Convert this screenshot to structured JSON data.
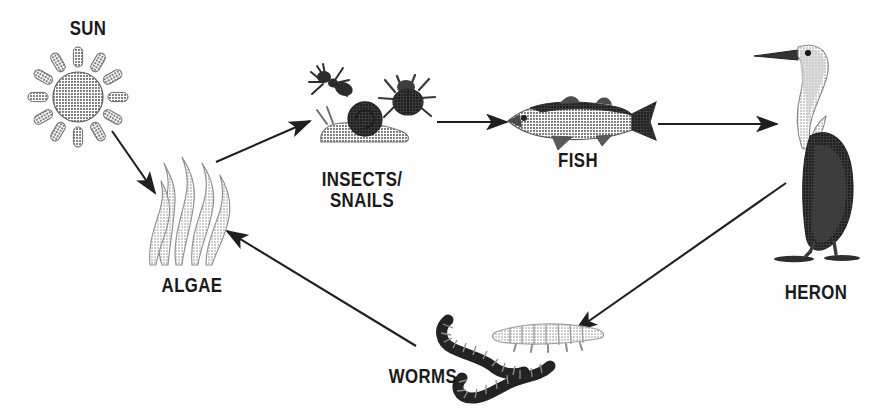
{
  "diagram": {
    "background_color": "#fdfdfd",
    "ink_color": "#1a1a1a",
    "style": "grayscale halftone illustration"
  },
  "nodes": [
    {
      "id": "sun",
      "label": "SUN",
      "icon": "sun-icon",
      "label_x": 88,
      "label_y": 30,
      "icon_x": 78,
      "icon_y": 96,
      "font_size": 21,
      "colors": {
        "disc": "#7a7a7a",
        "rays": "#8a8a8a"
      }
    },
    {
      "id": "algae",
      "label": "ALGAE",
      "icon": "algae-icon",
      "label_x": 192,
      "label_y": 288,
      "icon_x": 192,
      "icon_y": 200,
      "font_size": 21,
      "colors": {
        "blade": "#b4b4b4",
        "outline": "#8d8d8d"
      }
    },
    {
      "id": "insects_snails",
      "label": "INSECTS/\nSNAILS",
      "icon": "insects-snails-icon",
      "label_x": 362,
      "label_y": 196,
      "icon_x": 352,
      "icon_y": 105,
      "font_size": 21,
      "colors": {
        "ant": "#2d2d2d",
        "beetle": "#4a4a4a",
        "snail_body": "#9a9a9a",
        "snail_shell": "#4e4e4e"
      }
    },
    {
      "id": "fish",
      "label": "FISH",
      "icon": "fish-icon",
      "label_x": 578,
      "label_y": 163,
      "icon_x": 578,
      "icon_y": 120,
      "font_size": 21,
      "colors": {
        "body": "#b0b0b0",
        "back": "#4e4e4e",
        "fin": "#6a6a6a"
      }
    },
    {
      "id": "heron",
      "label": "HERON",
      "icon": "heron-icon",
      "label_x": 812,
      "label_y": 295,
      "icon_x": 805,
      "icon_y": 150,
      "font_size": 21,
      "colors": {
        "body": "#4a4a4a",
        "neck": "#c8c8c8",
        "beak": "#3a3a3a",
        "legs": "#4a4a4a"
      }
    },
    {
      "id": "worms",
      "label": "WORMS",
      "icon": "worms-icon",
      "label_x": 418,
      "label_y": 379,
      "icon_x": 520,
      "icon_y": 345,
      "font_size": 21,
      "colors": {
        "dark_worm": "#232323",
        "light_worm": "#a9a9a9"
      }
    }
  ],
  "arrows": [
    {
      "id": "sun-to-algae",
      "from": "sun",
      "to": "algae",
      "x1": 112,
      "y1": 131,
      "x2": 155,
      "y2": 193
    },
    {
      "id": "algae-to-insects",
      "from": "algae",
      "to": "insects_snails",
      "x1": 216,
      "y1": 162,
      "x2": 310,
      "y2": 121
    },
    {
      "id": "insects-to-fish",
      "from": "insects_snails",
      "to": "fish",
      "x1": 437,
      "y1": 122,
      "x2": 507,
      "y2": 122
    },
    {
      "id": "fish-to-heron",
      "from": "fish",
      "to": "heron",
      "x1": 658,
      "y1": 124,
      "x2": 777,
      "y2": 124
    },
    {
      "id": "heron-to-worms",
      "from": "heron",
      "to": "worms",
      "x1": 786,
      "y1": 183,
      "x2": 576,
      "y2": 330
    },
    {
      "id": "worms-to-algae",
      "from": "worms",
      "to": "algae",
      "x1": 416,
      "y1": 346,
      "x2": 227,
      "y2": 231
    }
  ]
}
